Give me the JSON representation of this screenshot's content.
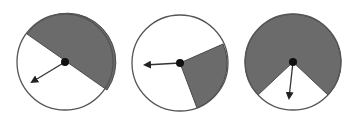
{
  "figure": {
    "colors": {
      "shaded": "#6b6b6b",
      "unshaded": "#ffffff",
      "outline": "#555555",
      "arrow": "#333333",
      "hub": "#111111"
    },
    "spinners": [
      {
        "id": "spinner-1",
        "center": [
          65,
          62
        ],
        "radius": 48,
        "shaded_fraction": "1/2",
        "shaded_path": "M27,34 L107,90 A48,48 0 0 0 27,34 Z",
        "arrow_tip": [
          32,
          82
        ]
      },
      {
        "id": "spinner-2",
        "center": [
          180,
          63
        ],
        "radius": 48,
        "shaded_fraction": "1/4",
        "shaded_path": "M180,63 L223,44 A48,48 0 0 1 197,108 Z",
        "arrow_tip": [
          145,
          65
        ]
      },
      {
        "id": "spinner-3",
        "center": [
          293,
          62
        ],
        "radius": 48,
        "shaded_fraction": "3/4",
        "shaded_path": "M293,62 L258,95 A48,48 0 1 1 328,95 Z",
        "arrow_tip": [
          289,
          98
        ]
      }
    ]
  }
}
